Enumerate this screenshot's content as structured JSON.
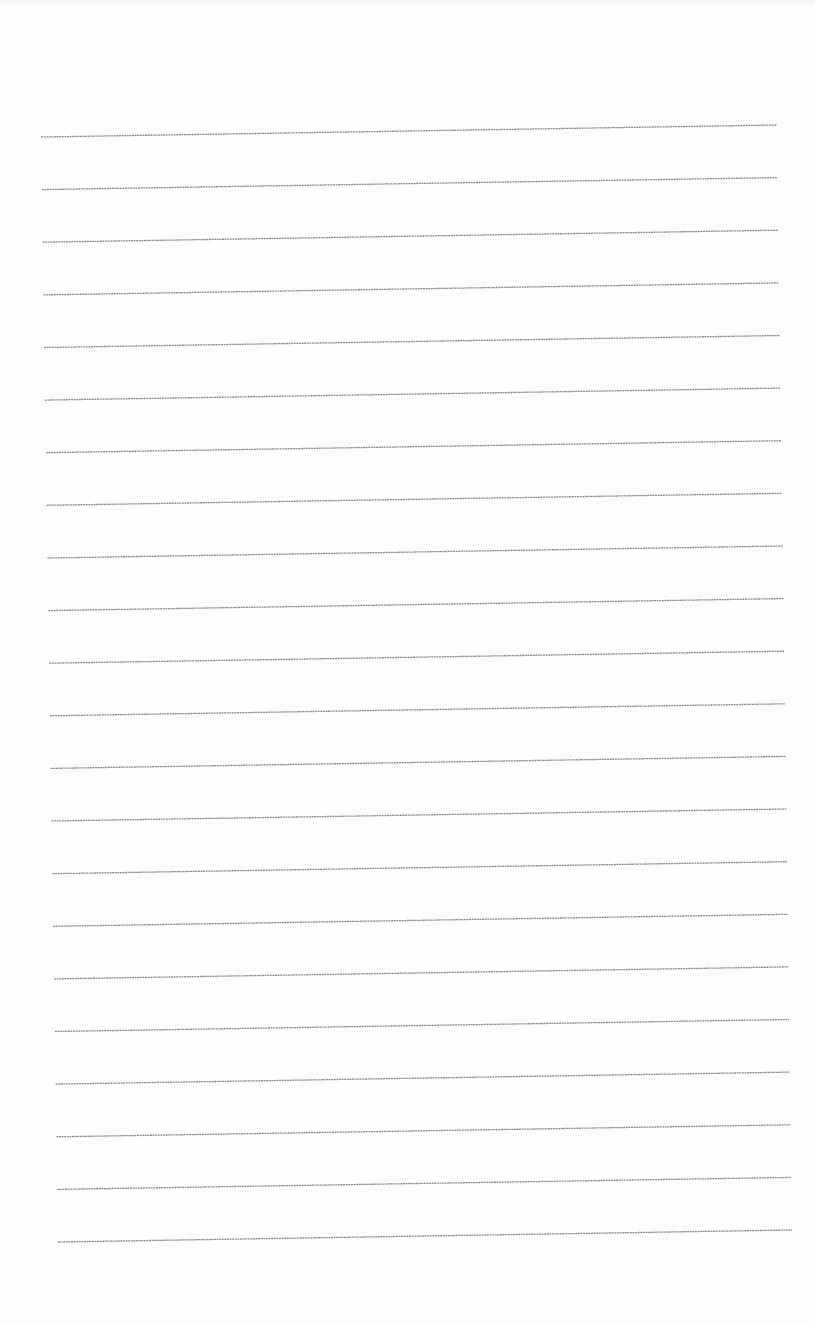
{
  "document": {
    "type": "lined-paper",
    "background_color": "#fefefe",
    "line_color": "#8a8a8a",
    "line_width": 1.3,
    "line_count": 22,
    "first_line": {
      "x1": 41,
      "y1": 137,
      "x2": 777,
      "y2": 125
    },
    "last_line": {
      "x1": 58,
      "y1": 1242,
      "x2": 792,
      "y2": 1230
    },
    "line_spacing": 52.6,
    "text": ""
  }
}
